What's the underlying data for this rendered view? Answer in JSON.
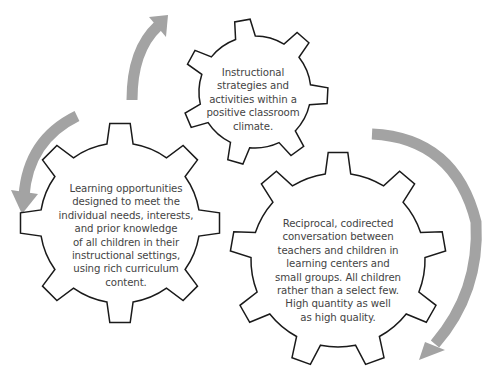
{
  "diagram": {
    "gears": [
      {
        "id": "top",
        "text": "Instructional\nstrategies and\nactivities within a\npositive classroom\nclimate."
      },
      {
        "id": "left",
        "text": "Learning opportunities\ndesigned to meet the\nindividual needs, interests,\nand prior knowledge\nof all children in their\ninstructional settings,\nusing rich curriculum\ncontent."
      },
      {
        "id": "right",
        "text": "Reciprocal, codirected\nconversation between\nteachers and children in\nlearning centers and\nsmall groups. All children\nrather than a select few.\nHigh quantity as well\nas high quality."
      }
    ],
    "arrows": [
      {
        "id": "arrow-top-left",
        "direction": "clockwise-up"
      },
      {
        "id": "arrow-left",
        "direction": "counterclockwise-down"
      },
      {
        "id": "arrow-right",
        "direction": "clockwise-down"
      }
    ],
    "colors": {
      "gear_outline": "#1a1a1a",
      "arrow": "#a3a3a3",
      "text": "#444444",
      "background": "#ffffff"
    }
  }
}
